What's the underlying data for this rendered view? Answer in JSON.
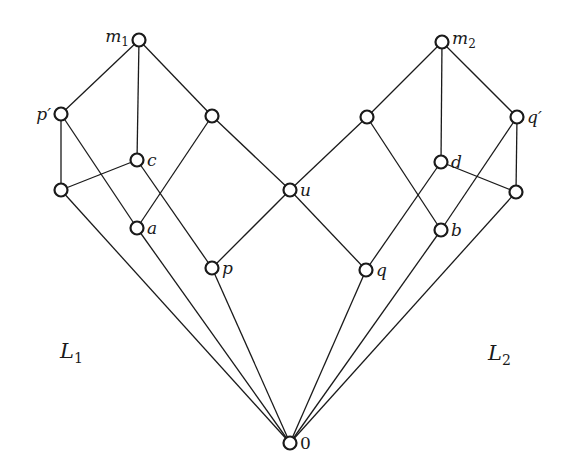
{
  "diagram": {
    "type": "lattice-hasse-diagram",
    "nodes": [
      {
        "id": "m1",
        "label": "m",
        "sub": "1",
        "x": 139,
        "y": 40,
        "label_pos": "left"
      },
      {
        "id": "pp",
        "label": "p′",
        "sub": "",
        "x": 61,
        "y": 114,
        "label_pos": "left"
      },
      {
        "id": "c",
        "label": "c",
        "sub": "",
        "x": 137,
        "y": 160,
        "label_pos": "right"
      },
      {
        "id": "lb",
        "label": "",
        "sub": "",
        "x": 61,
        "y": 190,
        "label_pos": "none"
      },
      {
        "id": "a",
        "label": "a",
        "sub": "",
        "x": 137,
        "y": 228,
        "label_pos": "right"
      },
      {
        "id": "r1",
        "label": "",
        "sub": "",
        "x": 212,
        "y": 116,
        "label_pos": "none"
      },
      {
        "id": "p",
        "label": "p",
        "sub": "",
        "x": 212,
        "y": 268,
        "label_pos": "right"
      },
      {
        "id": "u",
        "label": "u",
        "sub": "",
        "x": 290,
        "y": 190,
        "label_pos": "right"
      },
      {
        "id": "q",
        "label": "q",
        "sub": "",
        "x": 366,
        "y": 270,
        "label_pos": "right"
      },
      {
        "id": "l2",
        "label": "",
        "sub": "",
        "x": 367,
        "y": 117,
        "label_pos": "none"
      },
      {
        "id": "m2",
        "label": "m",
        "sub": "2",
        "x": 442,
        "y": 42,
        "label_pos": "right"
      },
      {
        "id": "d",
        "label": "d",
        "sub": "",
        "x": 441,
        "y": 162,
        "label_pos": "right"
      },
      {
        "id": "b",
        "label": "b",
        "sub": "",
        "x": 441,
        "y": 230,
        "label_pos": "right"
      },
      {
        "id": "qp",
        "label": "q′",
        "sub": "",
        "x": 517,
        "y": 117,
        "label_pos": "right"
      },
      {
        "id": "rb",
        "label": "",
        "sub": "",
        "x": 516,
        "y": 192,
        "label_pos": "none"
      },
      {
        "id": "zero",
        "label": "0",
        "sub": "",
        "x": 290,
        "y": 443,
        "label_pos": "right"
      }
    ],
    "edges": [
      [
        "m1",
        "pp"
      ],
      [
        "m1",
        "c"
      ],
      [
        "m1",
        "r1"
      ],
      [
        "pp",
        "lb"
      ],
      [
        "pp",
        "a"
      ],
      [
        "c",
        "lb"
      ],
      [
        "c",
        "p"
      ],
      [
        "r1",
        "a"
      ],
      [
        "r1",
        "u"
      ],
      [
        "u",
        "p"
      ],
      [
        "u",
        "q"
      ],
      [
        "m2",
        "l2"
      ],
      [
        "m2",
        "d"
      ],
      [
        "m2",
        "qp"
      ],
      [
        "l2",
        "u"
      ],
      [
        "l2",
        "b"
      ],
      [
        "d",
        "q"
      ],
      [
        "d",
        "rb"
      ],
      [
        "qp",
        "rb"
      ],
      [
        "qp",
        "b"
      ],
      [
        "zero",
        "lb"
      ],
      [
        "zero",
        "a"
      ],
      [
        "zero",
        "p"
      ],
      [
        "zero",
        "q"
      ],
      [
        "zero",
        "b"
      ],
      [
        "zero",
        "rb"
      ]
    ],
    "region_labels": [
      {
        "id": "L1",
        "label": "L",
        "sub": "1",
        "x": 60,
        "y": 358
      },
      {
        "id": "L2",
        "label": "L",
        "sub": "2",
        "x": 488,
        "y": 360
      }
    ]
  }
}
